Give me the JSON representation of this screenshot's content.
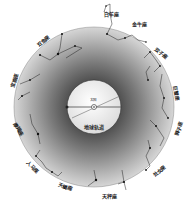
{
  "diagram": {
    "type": "zodiac-ecliptic-star-chart",
    "center": {
      "x": 94,
      "y": 107
    },
    "outer_ring_radius": 80,
    "inner_circle_radius": 27,
    "colors": {
      "background": "#ffffff",
      "ring_outer": "#d8d8d8",
      "ring_inner": "#5a5a5a",
      "inner_circle": "#f4f4f4",
      "lines": "#222222",
      "stars": "#111111"
    },
    "center_labels": {
      "top": "太阳",
      "bottom": "地球轨道"
    },
    "constellations": [
      {
        "id": "aries",
        "label": "白羊座",
        "x": 112,
        "y": 14
      },
      {
        "id": "taurus",
        "label": "金牛座",
        "x": 138,
        "y": 24
      },
      {
        "id": "gemini",
        "label": "双子座",
        "x": 162,
        "y": 52
      },
      {
        "id": "cancer",
        "label": "巨蟹座",
        "x": 176,
        "y": 92
      },
      {
        "id": "leo",
        "label": "狮子座",
        "x": 178,
        "y": 130
      },
      {
        "id": "virgo",
        "label": "处女座",
        "x": 158,
        "y": 172
      },
      {
        "id": "libra",
        "label": "天秤座",
        "x": 108,
        "y": 196
      },
      {
        "id": "scorpius",
        "label": "天蝎座",
        "x": 64,
        "y": 186
      },
      {
        "id": "sagittarius",
        "label": "人马座",
        "x": 32,
        "y": 166
      },
      {
        "id": "capricornus",
        "label": "摩羯座",
        "x": 18,
        "y": 128
      },
      {
        "id": "aquarius",
        "label": "宝瓶座",
        "x": 14,
        "y": 82
      },
      {
        "id": "pisces",
        "label": "双鱼座",
        "x": 42,
        "y": 42
      }
    ]
  }
}
